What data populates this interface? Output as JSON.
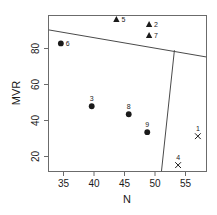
{
  "chart_data": {
    "type": "scatter",
    "title": "",
    "xlabel": "N",
    "ylabel": "MVR",
    "xlim": [
      33.0,
      58.6
    ],
    "ylim": [
      14.8,
      93.0
    ],
    "xticks": [
      35,
      40,
      45,
      50,
      55
    ],
    "yticks": [
      20,
      40,
      60,
      80
    ],
    "grid": false,
    "legend": "none",
    "series": [
      {
        "name": "triangle-group",
        "marker": "triangle",
        "points": [
          {
            "label": "5",
            "x": 44.0,
            "y": 91.0
          },
          {
            "label": "2",
            "x": 49.3,
            "y": 88.5
          },
          {
            "label": "7",
            "x": 49.3,
            "y": 83.0
          }
        ]
      },
      {
        "name": "circle-group",
        "marker": "circle",
        "points": [
          {
            "label": "6",
            "x": 35.0,
            "y": 79.0
          },
          {
            "label": "3",
            "x": 40.0,
            "y": 47.5
          },
          {
            "label": "8",
            "x": 46.0,
            "y": 43.5
          },
          {
            "label": "9",
            "x": 49.0,
            "y": 34.5
          }
        ]
      },
      {
        "name": "cross-group",
        "marker": "cross",
        "points": [
          {
            "label": "1",
            "x": 57.2,
            "y": 32.5
          },
          {
            "label": "4",
            "x": 54.0,
            "y": 18.0
          }
        ]
      }
    ],
    "boundary_lines": [
      {
        "name": "upper-boundary",
        "from": {
          "x": 33.0,
          "y": 85.8
        },
        "to": {
          "x": 58.6,
          "y": 72.2
        }
      },
      {
        "name": "lower-boundary",
        "from": {
          "x": 53.4,
          "y": 75.6
        },
        "to": {
          "x": 51.3,
          "y": 14.8
        }
      }
    ]
  },
  "axes": {
    "x_label": "N",
    "y_label": "MVR",
    "x_tick_labels": [
      "35",
      "40",
      "45",
      "50",
      "55"
    ],
    "y_tick_labels": [
      "20",
      "40",
      "60",
      "80"
    ]
  },
  "colors": {
    "ink": "#1a1a1a",
    "frame": "#6b6b6b",
    "background": "#ffffff"
  },
  "caption": {
    "text": ""
  }
}
